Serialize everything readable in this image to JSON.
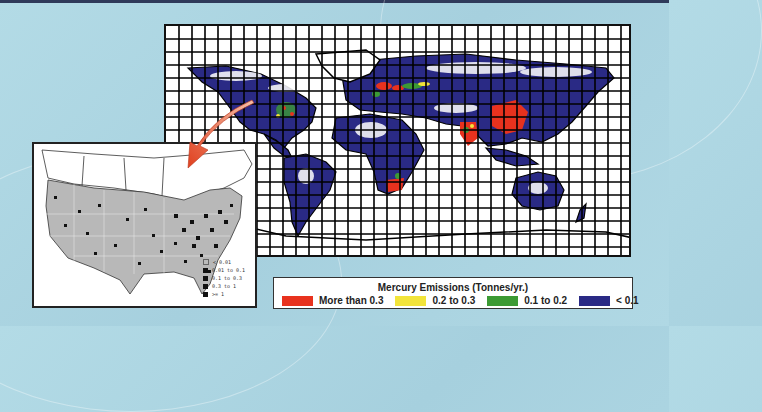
{
  "figure": {
    "title": "Mercury Emissions (Tonnes/yr.)",
    "background_color": "#aad3e0"
  },
  "world_map": {
    "description": "Global gridded map of mercury emissions",
    "grid": {
      "columns": 36,
      "rows": 18
    }
  },
  "legend": {
    "title": "Mercury Emissions (Tonnes/yr.)",
    "items": [
      {
        "label": "More than 0.3",
        "color": "#e8321e"
      },
      {
        "label": "0.2 to 0.3",
        "color": "#f2e43a"
      },
      {
        "label": "0.1 to 0.2",
        "color": "#3c9a34"
      },
      {
        "label": "< 0.1",
        "color": "#2a2a85"
      }
    ]
  },
  "inset_map": {
    "description": "United States detail map of mercury emission sources",
    "legend": [
      {
        "label": "< 0.01"
      },
      {
        "label": "0.01 to 0.1"
      },
      {
        "label": "0.1 to 0.3"
      },
      {
        "label": "0.3 to 1"
      },
      {
        "label": ">= 1"
      }
    ]
  },
  "arrow": {
    "color": "#e84a2a",
    "from": "north-america-on-world-map",
    "to": "inset-map"
  }
}
